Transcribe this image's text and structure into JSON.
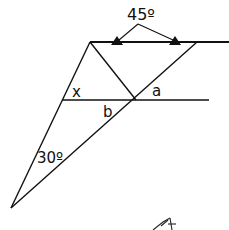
{
  "diagram": {
    "type": "geometry",
    "stroke_color": "#111111",
    "labels": {
      "top_angle": "45º",
      "angle_x": "x",
      "angle_a": "a",
      "angle_b": "b",
      "bottom_angle": "30º"
    },
    "points": {
      "top_left": [
        90,
        42
      ],
      "top_right_end": [
        229,
        42
      ],
      "top_right_diag": [
        197,
        42
      ],
      "middle_left": [
        62,
        100
      ],
      "middle_right_end": [
        209,
        100
      ],
      "intersection": [
        136,
        100
      ],
      "bottom": [
        11,
        208
      ],
      "arrow_apex": [
        138,
        24
      ],
      "arrow_left_tip": [
        117,
        42
      ],
      "arrow_right_tip": [
        175,
        42
      ]
    }
  }
}
